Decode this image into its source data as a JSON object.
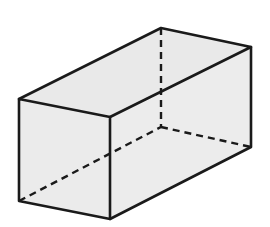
{
  "diagram": {
    "type": "rectangular-prism",
    "fill_color": "#ebebeb",
    "edge_color": "#1a1a1a",
    "background": "#ffffff",
    "vertices": {
      "front_top_left": [
        19,
        99
      ],
      "front_top_right": [
        110,
        117
      ],
      "front_bottom_left": [
        19,
        201
      ],
      "front_bottom_right": [
        110,
        219
      ],
      "back_top_left": [
        161,
        28
      ],
      "back_top_right": [
        251,
        47
      ],
      "back_bottom_right": [
        251,
        147
      ],
      "back_bottom_left_hidden": [
        161,
        127
      ]
    },
    "visible_edges": 9,
    "hidden_edges": 3
  }
}
